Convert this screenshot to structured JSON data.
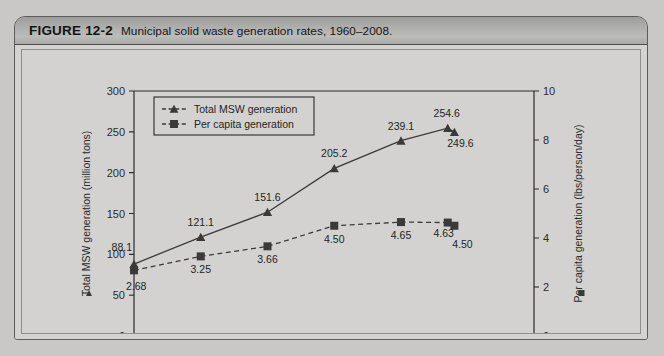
{
  "figure": {
    "number_label": "FIGURE 12-2",
    "caption": "Municipal solid waste generation rates, 1960–2008."
  },
  "chart_data": {
    "type": "line",
    "title": "",
    "xlabel": "",
    "x": [
      1960,
      1970,
      1980,
      1990,
      2000,
      2007,
      2008
    ],
    "categories": [
      "1960",
      "1970",
      "1980",
      "1990",
      "2000",
      "2007",
      "2008"
    ],
    "xtick_labels": [
      "1960",
      "1970",
      "1980",
      "1990",
      "2000",
      "2007",
      "2008"
    ],
    "grid": false,
    "legend_position": "top-left",
    "series": [
      {
        "name": "Total MSW generation",
        "axis": "left",
        "marker": "triangle",
        "line_style": "solid",
        "color": "#3a3a3a",
        "values": [
          88.1,
          121.1,
          151.6,
          205.2,
          239.1,
          254.6,
          249.6
        ],
        "data_labels": [
          "88.1",
          "121.1",
          "151.6",
          "205.2",
          "239.1",
          "254.6",
          "249.6"
        ]
      },
      {
        "name": "Per capita generation",
        "axis": "right",
        "marker": "square",
        "line_style": "dashed",
        "color": "#3a3a3a",
        "values": [
          2.68,
          3.25,
          3.66,
          4.5,
          4.65,
          4.63,
          4.5
        ],
        "data_labels": [
          "2.68",
          "3.25",
          "3.66",
          "4.50",
          "4.65",
          "4.63",
          "4.50"
        ]
      }
    ],
    "left_axis": {
      "label": "Total MSW generation (million tons)",
      "marker": "triangle",
      "ylim": [
        0,
        300
      ],
      "ticks": [
        0,
        50,
        100,
        150,
        200,
        250,
        300
      ],
      "tick_labels": [
        "0",
        "50",
        "100",
        "150",
        "200",
        "250",
        "300"
      ]
    },
    "right_axis": {
      "label": "Per capita generation (lbs/person/day)",
      "marker": "square",
      "ylim": [
        0,
        10
      ],
      "ticks": [
        0,
        2,
        4,
        6,
        8,
        10
      ],
      "tick_labels": [
        "0",
        "2",
        "4",
        "6",
        "8",
        "10"
      ]
    },
    "legend": [
      {
        "label": "Total MSW generation",
        "marker": "triangle",
        "line_style": "solid"
      },
      {
        "label": "Per capita generation",
        "marker": "square",
        "line_style": "dashed"
      }
    ]
  },
  "colors": {
    "page_background": "#c9c8c6",
    "panel_background": "#d3d2d0",
    "header_background": "#adadab",
    "ink": "#2b2b2b",
    "series": "#3a3a3a"
  }
}
